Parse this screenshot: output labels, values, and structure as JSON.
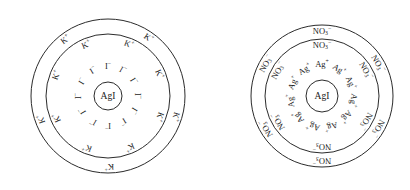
{
  "canvas": {
    "width": 410,
    "height": 190,
    "background": "#ffffff"
  },
  "style": {
    "stroke_color": "#2b2b2b",
    "text_color": "#1a1a1a",
    "stroke_width": 1
  },
  "diagrams": [
    {
      "id": "negatively-charged-agi-sol",
      "center": {
        "x": 108,
        "y": 96
      },
      "core_label": "AgI",
      "core_radius": 14,
      "rings": [
        {
          "name": "inner-ring",
          "radius": 30,
          "label_radius": 29,
          "ion": {
            "base": "I",
            "sub": "",
            "sup": "−",
            "text": "I⁻"
          },
          "count": 12,
          "font_size": 8.5,
          "start_angle": -90,
          "show_circle": false
        },
        {
          "name": "middle-ring",
          "radius": 62,
          "label_radius": 55,
          "ion": {
            "base": "K",
            "sub": "",
            "sup": "+",
            "text": "K⁺"
          },
          "count": 8,
          "font_size": 8.5,
          "start_angle": -68,
          "show_circle": true
        },
        {
          "name": "outer-ring",
          "radius": 77,
          "label_radius": 70,
          "ion": {
            "base": "K",
            "sub": "",
            "sup": "+",
            "text": "K⁺"
          },
          "count": 5,
          "font_size": 8.5,
          "start_angle": -55,
          "show_circle": true
        }
      ]
    },
    {
      "id": "positively-charged-agi-sol",
      "center": {
        "x": 322,
        "y": 96
      },
      "core_label": "AgI",
      "core_radius": 16,
      "rings": [
        {
          "name": "inner-ring",
          "radius": 34,
          "label_radius": 31,
          "ion": {
            "base": "Ag",
            "sub": "",
            "sup": "+",
            "text": "Ag⁺"
          },
          "count": 11,
          "font_size": 8.5,
          "start_angle": -90,
          "show_circle": false
        },
        {
          "name": "middle-ring",
          "radius": 57,
          "label_radius": 50,
          "ion": {
            "base": "NO",
            "sub": "3",
            "sup": "−",
            "text": "NO₃⁻"
          },
          "count": 6,
          "font_size": 8.5,
          "start_angle": -90,
          "show_circle": true
        },
        {
          "name": "outer-ring",
          "radius": 71,
          "label_radius": 64,
          "ion": {
            "base": "NO",
            "sub": "3",
            "sup": "−",
            "text": "NO₃⁻"
          },
          "count": 6,
          "font_size": 8.5,
          "start_angle": -90,
          "show_circle": true
        }
      ]
    }
  ]
}
